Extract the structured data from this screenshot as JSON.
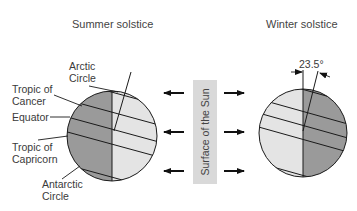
{
  "diagram": {
    "left": {
      "title": "Summer solstice",
      "labels": {
        "arctic_line1": "Arctic",
        "arctic_line2": "Circle",
        "cancer_line1": "Tropic of",
        "cancer_line2": "Cancer",
        "equator": "Equator",
        "capricorn_line1": "Tropic of",
        "capricorn_line2": "Capricorn",
        "antarctic_line1": "Antarctic",
        "antarctic_line2": "Circle"
      }
    },
    "center": {
      "sun_label": "Surface of the Sun",
      "arrows_left": 3,
      "arrows_right": 3
    },
    "right": {
      "title": "Winter solstice",
      "tilt_angle": "23.5°"
    },
    "colors": {
      "dark_side": "#9a9a9a",
      "light_side": "#e4e4e4",
      "sun_box": "#d9d9d9",
      "line": "#1a1a1a"
    }
  }
}
